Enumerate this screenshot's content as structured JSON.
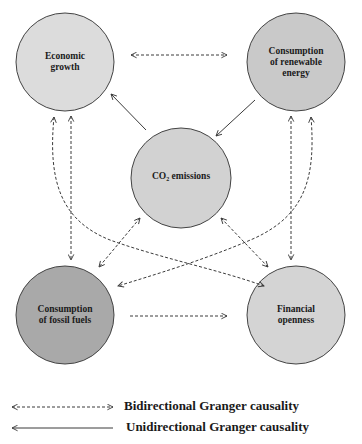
{
  "diagram": {
    "nodes": [
      {
        "id": "economic_growth",
        "label_lines": [
          "Economic",
          "growth"
        ],
        "fill": "#dcdcdc"
      },
      {
        "id": "renewable_energy",
        "label_lines": [
          "Consumption",
          "of renewable",
          "energy"
        ],
        "fill": "#c9c9c9"
      },
      {
        "id": "co2_emissions",
        "label": "CO",
        "label_sub": "2",
        "label_rest": " emissions",
        "fill": "#d2d2d2"
      },
      {
        "id": "fossil_fuels",
        "label_lines": [
          "Consumption",
          "of fossil fuels"
        ],
        "fill": "#a9a9a9"
      },
      {
        "id": "financial_openness",
        "label_lines": [
          "Financial",
          "openness"
        ],
        "fill": "#d4d4d4"
      }
    ],
    "edges": [
      {
        "from": "economic_growth",
        "to": "renewable_energy",
        "type": "bidirectional"
      },
      {
        "from": "co2_emissions",
        "to": "economic_growth",
        "type": "unidirectional"
      },
      {
        "from": "renewable_energy",
        "to": "co2_emissions",
        "type": "unidirectional"
      },
      {
        "from": "economic_growth",
        "to": "fossil_fuels",
        "type": "bidirectional"
      },
      {
        "from": "economic_growth",
        "to": "financial_openness",
        "type": "bidirectional"
      },
      {
        "from": "renewable_energy",
        "to": "financial_openness",
        "type": "bidirectional"
      },
      {
        "from": "renewable_energy",
        "to": "fossil_fuels",
        "type": "bidirectional"
      },
      {
        "from": "co2_emissions",
        "to": "fossil_fuels",
        "type": "bidirectional"
      },
      {
        "from": "co2_emissions",
        "to": "financial_openness",
        "type": "bidirectional"
      },
      {
        "from": "fossil_fuels",
        "to": "financial_openness",
        "type": "bidirectional"
      }
    ]
  },
  "legend": {
    "bidirectional": "Bidirectional Granger causality",
    "unidirectional": "Unidirectional Granger causality"
  },
  "colors": {
    "stroke": "#333333",
    "arrow": "#3a3a3a"
  }
}
